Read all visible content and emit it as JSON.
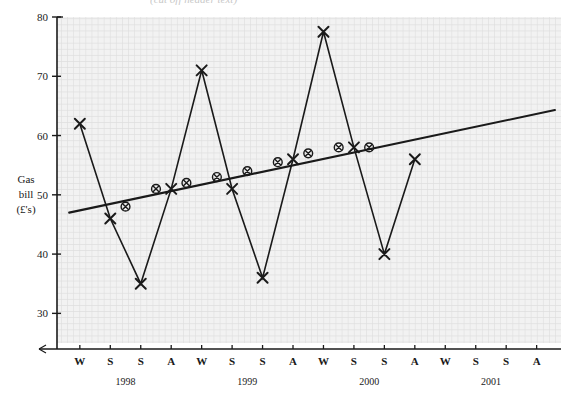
{
  "figure": {
    "top_caption_fragment": "(cut off header text)",
    "background": "#f2f2f2",
    "grid_color": "#d8d8d8",
    "ink_color": "#1a1a1a"
  },
  "chart_data": {
    "type": "line",
    "title": "",
    "xlabel": "",
    "ylabel": "Gas bill (£'s)",
    "ylabel_lines": [
      "Gas",
      "bill",
      "(£'s)"
    ],
    "ylim": [
      25,
      80
    ],
    "yticks": [
      30,
      40,
      50,
      60,
      70,
      80
    ],
    "ytick_labels": [
      "30",
      "40",
      "50",
      "60",
      "70",
      "80"
    ],
    "grid": true,
    "legend": "none",
    "x": [
      "W",
      "S",
      "S",
      "A",
      "W",
      "S",
      "S",
      "A",
      "W",
      "S",
      "S",
      "A",
      "W",
      "S",
      "S",
      "A"
    ],
    "xtick_labels": [
      "W",
      "S",
      "S",
      "A",
      "W",
      "S",
      "S",
      "A",
      "W",
      "S",
      "S",
      "A",
      "W",
      "S",
      "S",
      "A"
    ],
    "year_groups": [
      {
        "label": "1998",
        "start_index": 0,
        "end_index": 3
      },
      {
        "label": "1999",
        "start_index": 4,
        "end_index": 7
      },
      {
        "label": "2000",
        "start_index": 8,
        "end_index": 11
      },
      {
        "label": "2001",
        "start_index": 12,
        "end_index": 15
      }
    ],
    "series": [
      {
        "name": "Gas bill",
        "marker": "cross",
        "connected": true,
        "values": [
          62,
          46,
          35,
          51,
          71,
          51,
          36,
          56,
          77.5,
          58,
          40,
          56,
          null,
          null,
          null,
          null
        ]
      },
      {
        "name": "Moving average",
        "marker": "circled-cross",
        "connected": false,
        "x_offset": 0.5,
        "values": [
          48,
          51,
          52,
          53,
          54,
          55.5,
          57,
          58,
          58,
          null,
          null,
          null,
          null,
          null,
          null,
          null
        ],
        "x_positions": [
          1.5,
          2.5,
          3.5,
          4.5,
          5.5,
          6.5,
          7.5,
          8.5,
          9.5
        ]
      }
    ],
    "trend_line": {
      "name": "Trend line",
      "x_start": -0.35,
      "y_start": 47,
      "x_end": 15.6,
      "y_end": 64.3
    }
  }
}
